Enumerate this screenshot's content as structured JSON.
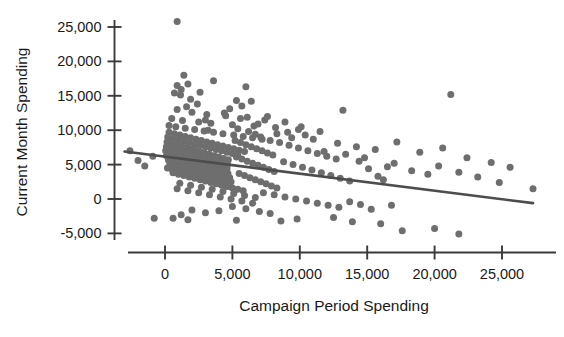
{
  "chart_data": {
    "type": "scatter",
    "title": "",
    "xlabel": "Campaign Period Spending",
    "ylabel": "Current Month Spending",
    "xlim": [
      -4000,
      29500
    ],
    "ylim": [
      -7500,
      27000
    ],
    "xticks": [
      0,
      5000,
      10000,
      15000,
      20000,
      25000
    ],
    "xticklabels": [
      "0",
      "5,000",
      "10,000",
      "15,000",
      "20,000",
      "25,000"
    ],
    "yticks": [
      -5000,
      0,
      5000,
      10000,
      15000,
      20000,
      25000
    ],
    "yticklabels": [
      "-5,000",
      "0",
      "5,000",
      "10,000",
      "15,000",
      "20,000",
      "25,000"
    ],
    "grid": false,
    "legend": null,
    "point_color": "#6e6e6e",
    "point_size": 7,
    "line_color": "#4d4d4d",
    "trendline": {
      "type": "linear",
      "x_start": -3000,
      "y_start": 6900,
      "x_end": 27300,
      "y_end": -600,
      "slope": -0.2475,
      "intercept": 6160
    },
    "n_points": 306,
    "points": [
      [
        900,
        25800
      ],
      [
        1400,
        18000
      ],
      [
        3600,
        17200
      ],
      [
        6000,
        16300
      ],
      [
        1700,
        16700
      ],
      [
        900,
        16500
      ],
      [
        1200,
        15900
      ],
      [
        1150,
        15100
      ],
      [
        700,
        15400
      ],
      [
        5300,
        14300
      ],
      [
        1900,
        14500
      ],
      [
        6400,
        14200
      ],
      [
        5700,
        13500
      ],
      [
        21200,
        15200
      ],
      [
        900,
        13000
      ],
      [
        2000,
        12600
      ],
      [
        3100,
        12300
      ],
      [
        4500,
        12100
      ],
      [
        6100,
        11900
      ],
      [
        7400,
        11500
      ],
      [
        500,
        11700
      ],
      [
        1300,
        11400
      ],
      [
        2500,
        11200
      ],
      [
        3400,
        11000
      ],
      [
        5000,
        10800
      ],
      [
        6600,
        10600
      ],
      [
        8200,
        10400
      ],
      [
        9900,
        10100
      ],
      [
        11500,
        9800
      ],
      [
        13200,
        12900
      ],
      [
        300,
        10700
      ],
      [
        800,
        10500
      ],
      [
        1500,
        10300
      ],
      [
        2200,
        10100
      ],
      [
        2900,
        9900
      ],
      [
        3600,
        9700
      ],
      [
        4300,
        9500
      ],
      [
        5100,
        9300
      ],
      [
        5800,
        9100
      ],
      [
        6500,
        8900
      ],
      [
        7200,
        8700
      ],
      [
        300,
        9700
      ],
      [
        700,
        9500
      ],
      [
        1100,
        9300
      ],
      [
        1500,
        9100
      ],
      [
        1900,
        8900
      ],
      [
        2300,
        8700
      ],
      [
        2700,
        8500
      ],
      [
        3100,
        8300
      ],
      [
        3500,
        8100
      ],
      [
        3900,
        7900
      ],
      [
        4300,
        7700
      ],
      [
        4700,
        7500
      ],
      [
        5100,
        7300
      ],
      [
        5500,
        7100
      ],
      [
        5900,
        6900
      ],
      [
        200,
        9000
      ],
      [
        600,
        8800
      ],
      [
        1000,
        8600
      ],
      [
        1400,
        8400
      ],
      [
        1800,
        8200
      ],
      [
        2200,
        8000
      ],
      [
        2600,
        7800
      ],
      [
        3000,
        7600
      ],
      [
        3400,
        7400
      ],
      [
        3800,
        7200
      ],
      [
        4200,
        7000
      ],
      [
        4600,
        6800
      ],
      [
        5000,
        6600
      ],
      [
        5400,
        6400
      ],
      [
        150,
        8300
      ],
      [
        500,
        8100
      ],
      [
        850,
        7900
      ],
      [
        1200,
        7700
      ],
      [
        1550,
        7500
      ],
      [
        1900,
        7300
      ],
      [
        2250,
        7100
      ],
      [
        2600,
        6900
      ],
      [
        2950,
        6700
      ],
      [
        3300,
        6500
      ],
      [
        3650,
        6300
      ],
      [
        4000,
        6100
      ],
      [
        4350,
        5900
      ],
      [
        4700,
        5700
      ],
      [
        100,
        7600
      ],
      [
        450,
        7400
      ],
      [
        800,
        7200
      ],
      [
        1150,
        7000
      ],
      [
        1500,
        6800
      ],
      [
        1850,
        6600
      ],
      [
        2200,
        6400
      ],
      [
        2550,
        6200
      ],
      [
        2900,
        6000
      ],
      [
        3250,
        5800
      ],
      [
        3600,
        5600
      ],
      [
        3950,
        5400
      ],
      [
        4300,
        5200
      ],
      [
        4650,
        5000
      ],
      [
        50,
        7000
      ],
      [
        400,
        6800
      ],
      [
        750,
        6600
      ],
      [
        1100,
        6400
      ],
      [
        1450,
        6200
      ],
      [
        1800,
        6000
      ],
      [
        2150,
        5800
      ],
      [
        2500,
        5600
      ],
      [
        2850,
        5400
      ],
      [
        3200,
        5200
      ],
      [
        3550,
        5000
      ],
      [
        3900,
        4800
      ],
      [
        4250,
        4600
      ],
      [
        4600,
        4400
      ],
      [
        120,
        6300
      ],
      [
        470,
        6100
      ],
      [
        820,
        5900
      ],
      [
        1170,
        5700
      ],
      [
        1520,
        5500
      ],
      [
        1870,
        5300
      ],
      [
        2220,
        5100
      ],
      [
        2570,
        4900
      ],
      [
        2920,
        4700
      ],
      [
        3270,
        4500
      ],
      [
        3620,
        4300
      ],
      [
        3970,
        4100
      ],
      [
        4320,
        3900
      ],
      [
        4670,
        3700
      ],
      [
        250,
        5700
      ],
      [
        600,
        5500
      ],
      [
        950,
        5300
      ],
      [
        1300,
        5100
      ],
      [
        1650,
        4900
      ],
      [
        2000,
        4700
      ],
      [
        2350,
        4500
      ],
      [
        2700,
        4300
      ],
      [
        3050,
        4100
      ],
      [
        3400,
        3900
      ],
      [
        3750,
        3700
      ],
      [
        4100,
        3500
      ],
      [
        4450,
        3300
      ],
      [
        4800,
        3100
      ],
      [
        350,
        5100
      ],
      [
        700,
        4900
      ],
      [
        1050,
        4700
      ],
      [
        1400,
        4500
      ],
      [
        1750,
        4300
      ],
      [
        2100,
        4100
      ],
      [
        2450,
        3900
      ],
      [
        2800,
        3700
      ],
      [
        3150,
        3500
      ],
      [
        3500,
        3300
      ],
      [
        3850,
        3100
      ],
      [
        4200,
        2900
      ],
      [
        4550,
        2700
      ],
      [
        4900,
        2500
      ],
      [
        180,
        4500
      ],
      [
        530,
        4300
      ],
      [
        880,
        4100
      ],
      [
        1230,
        3900
      ],
      [
        1580,
        3700
      ],
      [
        1930,
        3500
      ],
      [
        2280,
        3300
      ],
      [
        2630,
        3100
      ],
      [
        2980,
        2900
      ],
      [
        3330,
        2700
      ],
      [
        3680,
        2500
      ],
      [
        4030,
        2300
      ],
      [
        4380,
        2100
      ],
      [
        4730,
        1900
      ],
      [
        600,
        3800
      ],
      [
        1000,
        3600
      ],
      [
        1400,
        3400
      ],
      [
        1800,
        3200
      ],
      [
        2200,
        3000
      ],
      [
        2600,
        2800
      ],
      [
        3000,
        2600
      ],
      [
        3400,
        2400
      ],
      [
        3800,
        2200
      ],
      [
        4200,
        2000
      ],
      [
        4600,
        1800
      ],
      [
        5000,
        1600
      ],
      [
        5400,
        1400
      ],
      [
        5800,
        1200
      ],
      [
        5200,
        8500
      ],
      [
        5600,
        8200
      ],
      [
        6000,
        7900
      ],
      [
        6400,
        7600
      ],
      [
        6800,
        7300
      ],
      [
        7200,
        7000
      ],
      [
        7600,
        6700
      ],
      [
        8000,
        6400
      ],
      [
        5300,
        6100
      ],
      [
        5700,
        5800
      ],
      [
        6100,
        5500
      ],
      [
        6500,
        5200
      ],
      [
        6900,
        4900
      ],
      [
        7300,
        4600
      ],
      [
        7700,
        4300
      ],
      [
        8100,
        4000
      ],
      [
        5500,
        3700
      ],
      [
        5900,
        3400
      ],
      [
        6300,
        3100
      ],
      [
        6700,
        2800
      ],
      [
        7100,
        2500
      ],
      [
        7500,
        2200
      ],
      [
        7900,
        1900
      ],
      [
        8300,
        1600
      ],
      [
        6200,
        9800
      ],
      [
        6700,
        9400
      ],
      [
        7100,
        9000
      ],
      [
        5400,
        10200
      ],
      [
        7800,
        8500
      ],
      [
        8500,
        8200
      ],
      [
        9200,
        7800
      ],
      [
        9900,
        7400
      ],
      [
        10600,
        7000
      ],
      [
        11300,
        6600
      ],
      [
        12000,
        6200
      ],
      [
        12700,
        5800
      ],
      [
        8800,
        5400
      ],
      [
        9500,
        5000
      ],
      [
        10200,
        4600
      ],
      [
        10900,
        4200
      ],
      [
        11600,
        3800
      ],
      [
        12300,
        3400
      ],
      [
        13000,
        3000
      ],
      [
        13700,
        2600
      ],
      [
        14400,
        5500
      ],
      [
        15100,
        4400
      ],
      [
        15800,
        3300
      ],
      [
        16500,
        4700
      ],
      [
        9100,
        9700
      ],
      [
        10400,
        9300
      ],
      [
        11800,
        6900
      ],
      [
        13400,
        6500
      ],
      [
        14800,
        6000
      ],
      [
        16200,
        2800
      ],
      [
        17000,
        5200
      ],
      [
        18300,
        4100
      ],
      [
        19500,
        3600
      ],
      [
        20300,
        4800
      ],
      [
        21800,
        3900
      ],
      [
        23200,
        3200
      ],
      [
        24800,
        2400
      ],
      [
        27300,
        1500
      ],
      [
        1100,
        2300
      ],
      [
        1900,
        2000
      ],
      [
        2700,
        1700
      ],
      [
        3500,
        1400
      ],
      [
        4300,
        1100
      ],
      [
        5100,
        800
      ],
      [
        5900,
        500
      ],
      [
        6700,
        200
      ],
      [
        900,
        1500
      ],
      [
        1700,
        1200
      ],
      [
        2500,
        900
      ],
      [
        3300,
        600
      ],
      [
        4100,
        300
      ],
      [
        4900,
        0
      ],
      [
        5700,
        -300
      ],
      [
        6500,
        -600
      ],
      [
        7300,
        900
      ],
      [
        8100,
        600
      ],
      [
        8900,
        300
      ],
      [
        9700,
        0
      ],
      [
        10500,
        -300
      ],
      [
        11300,
        -600
      ],
      [
        12100,
        -900
      ],
      [
        12900,
        -1200
      ],
      [
        13700,
        -400
      ],
      [
        14500,
        -800
      ],
      [
        15300,
        -1500
      ],
      [
        16800,
        -900
      ],
      [
        7000,
        -1800
      ],
      [
        7800,
        -2100
      ],
      [
        6000,
        -1400
      ],
      [
        5000,
        -1100
      ],
      [
        4000,
        -1700
      ],
      [
        3000,
        -2000
      ],
      [
        2000,
        -1600
      ],
      [
        1200,
        -2300
      ],
      [
        600,
        -2800
      ],
      [
        -800,
        -2800
      ],
      [
        1700,
        -3000
      ],
      [
        5300,
        -3100
      ],
      [
        8600,
        -3200
      ],
      [
        9800,
        -2900
      ],
      [
        12500,
        -2700
      ],
      [
        13900,
        -3300
      ],
      [
        16000,
        -3600
      ],
      [
        17600,
        -4600
      ],
      [
        20000,
        -4300
      ],
      [
        21800,
        -5100
      ],
      [
        -2600,
        7000
      ],
      [
        -1500,
        4800
      ],
      [
        -2000,
        5600
      ],
      [
        -900,
        6200
      ],
      [
        2400,
        13800
      ],
      [
        3000,
        11500
      ],
      [
        8900,
        11200
      ],
      [
        10100,
        10500
      ],
      [
        7600,
        12000
      ],
      [
        4800,
        13100
      ],
      [
        2600,
        15500
      ],
      [
        1600,
        13400
      ],
      [
        14200,
        7600
      ],
      [
        15600,
        7200
      ],
      [
        17200,
        8300
      ],
      [
        18900,
        6800
      ],
      [
        20600,
        7400
      ],
      [
        22400,
        6000
      ],
      [
        24200,
        5300
      ],
      [
        25600,
        4600
      ],
      [
        11000,
        8700
      ],
      [
        12800,
        8100
      ],
      [
        9400,
        8900
      ],
      [
        8300,
        9500
      ],
      [
        6900,
        10900
      ],
      [
        5600,
        11700
      ],
      [
        4400,
        12500
      ],
      [
        3200,
        10000
      ]
    ]
  },
  "figure": {
    "background": "#ffffff",
    "tick_color": "#3a3a3a"
  }
}
